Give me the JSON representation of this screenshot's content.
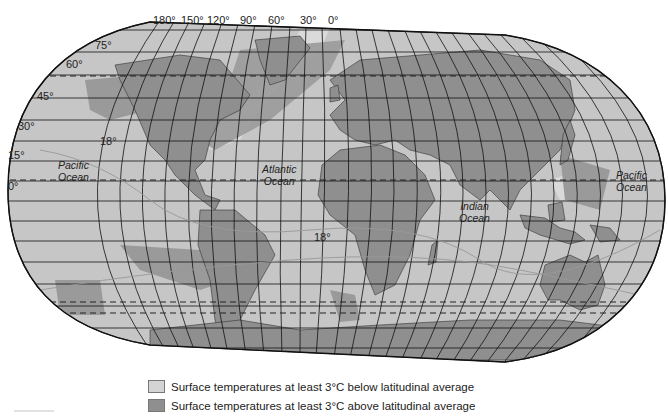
{
  "map": {
    "projection": "Robinson-like world map",
    "colors": {
      "ocean": "#c6c6c6",
      "land": "#8f8f8f",
      "cold_anomaly": "#dadada",
      "warm_anomaly": "#8f8f8f",
      "grid": "#111111",
      "isotherm": "#9a9a9a"
    },
    "longitude_labels": [
      "180°",
      "150°",
      "120°",
      "90°",
      "60°",
      "30°",
      "0°"
    ],
    "latitude_labels": [
      "75°",
      "60°",
      "45°",
      "30°",
      "15°",
      "0°"
    ],
    "isotherm_labels": [
      "18°",
      "18°"
    ],
    "ocean_labels": [
      {
        "name": "pacific-ocean-west",
        "line1": "Pacific",
        "line2": "Ocean"
      },
      {
        "name": "atlantic-ocean",
        "line1": "Atlantic",
        "line2": "Ocean"
      },
      {
        "name": "indian-ocean",
        "line1": "Indian",
        "line2": "Ocean"
      },
      {
        "name": "pacific-ocean-east",
        "line1": "Pacific",
        "line2": "Ocean"
      }
    ]
  },
  "legend": {
    "items": [
      {
        "label": "Surface temperatures at least 3°C below latitudinal average",
        "color": "#d4d4d4"
      },
      {
        "label": "Surface temperatures at least 3°C above latitudinal average",
        "color": "#8f8f8f"
      }
    ]
  }
}
